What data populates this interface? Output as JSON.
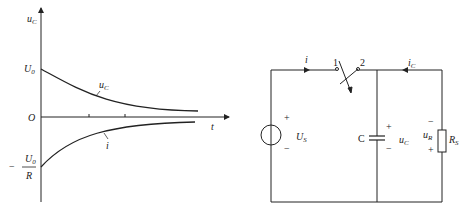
{
  "graph": {
    "y_axis_label": "u",
    "y_axis_label_sub": "C",
    "x_axis_label": "t",
    "origin_label": "O",
    "u0_label": "U",
    "u0_label_sub": "0",
    "neg_prefix": "−",
    "neg_numerator": "U",
    "neg_numerator_sub": "0",
    "neg_denominator": "R",
    "curve_uc_label": "u",
    "curve_uc_label_sub": "C",
    "curve_i_label": "i"
  },
  "circuit": {
    "current_i_label": "i",
    "switch_pos1": "1",
    "switch_pos2": "2",
    "current_ic_label": "i",
    "current_ic_sub": "C",
    "source_plus": "+",
    "source_minus": "−",
    "source_label": "U",
    "source_label_sub": "S",
    "cap_label": "C",
    "cap_plus": "+",
    "cap_minus": "−",
    "cap_voltage_label": "u",
    "cap_voltage_sub": "C",
    "res_minus": "−",
    "res_plus": "+",
    "res_voltage_label": "u",
    "res_voltage_sub": "R",
    "res_label": "R",
    "res_label_sub": "S"
  }
}
